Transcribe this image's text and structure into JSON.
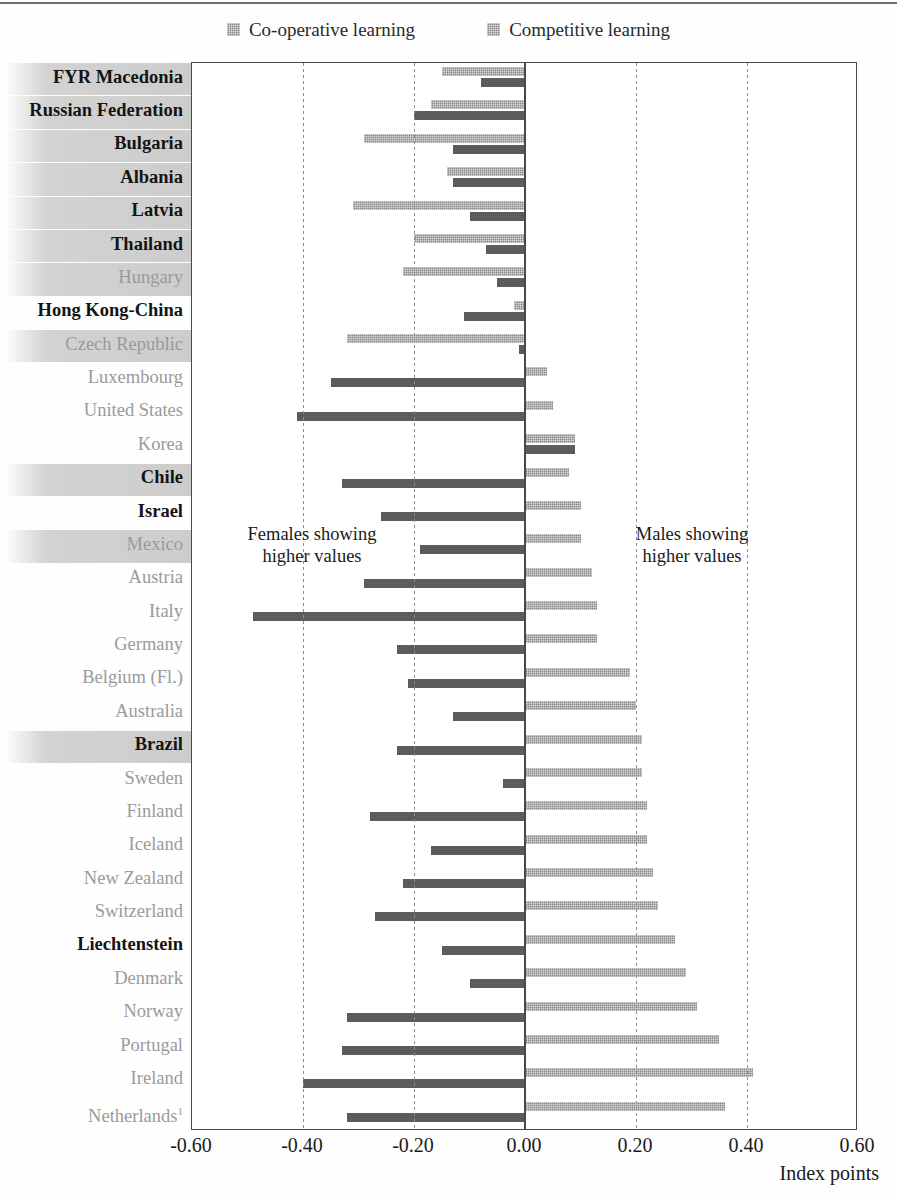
{
  "legend": {
    "items": [
      {
        "label": "Co-operative learning",
        "key": "coop",
        "color": "#5c5c5c"
      },
      {
        "label": "Competitive learning",
        "key": "comp",
        "color": "#8a8a8a"
      }
    ]
  },
  "annotations": {
    "left_line1": "Females showing",
    "left_line2": "higher values",
    "right_line1": "Males showing",
    "right_line2": "higher values"
  },
  "axis": {
    "title": "Index points",
    "ticks": [
      "-0.60",
      "-0.40",
      "-0.20",
      "0.00",
      "0.20",
      "0.40",
      "0.60"
    ],
    "tick_values": [
      -0.6,
      -0.4,
      -0.2,
      0.0,
      0.2,
      0.4,
      0.6
    ]
  },
  "chart_data": {
    "type": "bar",
    "orientation": "horizontal",
    "title": "",
    "xlabel": "Index points",
    "ylabel": "",
    "xlim": [
      -0.6,
      0.6
    ],
    "grid": true,
    "legend_position": "top-center",
    "categories": [
      "FYR Macedonia",
      "Russian Federation",
      "Bulgaria",
      "Albania",
      "Latvia",
      "Thailand",
      "Hungary",
      "Hong Kong-China",
      "Czech Republic",
      "Luxembourg",
      "United States",
      "Korea",
      "Chile",
      "Israel",
      "Mexico",
      "Austria",
      "Italy",
      "Germany",
      "Belgium (Fl.)",
      "Australia",
      "Brazil",
      "Sweden",
      "Finland",
      "Iceland",
      "New Zealand",
      "Switzerland",
      "Liechtenstein",
      "Denmark",
      "Norway",
      "Portugal",
      "Ireland",
      "Netherlands"
    ],
    "category_footnotes": {
      "Netherlands": "1"
    },
    "partner_countries": [
      "FYR Macedonia",
      "Russian Federation",
      "Bulgaria",
      "Albania",
      "Latvia",
      "Thailand",
      "Hong Kong-China",
      "Chile",
      "Israel",
      "Brazil",
      "Liechtenstein"
    ],
    "highlighted_rows": [
      "FYR Macedonia",
      "Russian Federation",
      "Bulgaria",
      "Albania",
      "Latvia",
      "Thailand",
      "Hungary",
      "Czech Republic",
      "Chile",
      "Mexico",
      "Brazil"
    ],
    "series": [
      {
        "name": "Competitive learning",
        "color": "#8a8a8a",
        "values": [
          -0.15,
          -0.17,
          -0.29,
          -0.14,
          -0.31,
          -0.2,
          -0.22,
          -0.02,
          -0.32,
          0.04,
          0.05,
          0.09,
          0.08,
          0.1,
          0.1,
          0.12,
          0.13,
          0.13,
          0.19,
          0.2,
          0.21,
          0.21,
          0.22,
          0.22,
          0.23,
          0.24,
          0.27,
          0.29,
          0.31,
          0.35,
          0.41,
          0.36
        ]
      },
      {
        "name": "Co-operative learning",
        "color": "#5c5c5c",
        "values": [
          -0.08,
          -0.2,
          -0.13,
          -0.13,
          -0.1,
          -0.07,
          -0.05,
          -0.11,
          -0.01,
          -0.35,
          -0.41,
          0.09,
          -0.33,
          -0.26,
          -0.19,
          -0.29,
          -0.49,
          -0.23,
          -0.21,
          -0.13,
          -0.23,
          -0.04,
          -0.28,
          -0.17,
          -0.22,
          -0.27,
          -0.15,
          -0.1,
          -0.32,
          -0.33,
          -0.4,
          -0.32
        ]
      }
    ]
  }
}
